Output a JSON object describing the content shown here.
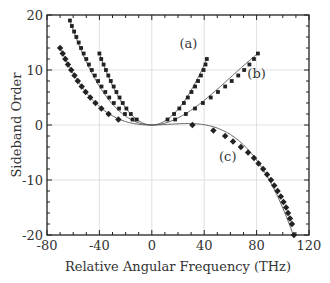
{
  "chart_data": {
    "type": "line",
    "title": "",
    "xlabel": "Relative Angular Frequency (THz)",
    "ylabel": "Sideband Order",
    "xlim": [
      -80,
      120
    ],
    "ylim": [
      -20,
      20
    ],
    "xticks": [
      -80,
      -40,
      0,
      40,
      80,
      120
    ],
    "yticks": [
      -20,
      -10,
      0,
      10,
      20
    ],
    "xtick_labels": [
      "-80",
      "-40",
      "0",
      "40",
      "80",
      "120"
    ],
    "ytick_labels": [
      "-20",
      "-10",
      "0",
      "10",
      "20"
    ],
    "grid": true,
    "legend": "none (curves labeled inline)",
    "series": [
      {
        "name": "(a)",
        "marker": "square",
        "fit": {
          "a2": 0.00748,
          "a3": -1.61e-05
        },
        "x": [
          -40,
          -38.6,
          -36.8,
          -35,
          -33.2,
          -31.3,
          -29.1,
          -27,
          -24.6,
          -22.2,
          -19.4,
          -16,
          -11.5,
          12,
          17,
          21,
          24.5,
          27.5,
          30.3,
          33,
          35.3,
          37.5,
          39.5,
          41,
          42
        ],
        "y": [
          13,
          12,
          11,
          10,
          9,
          8,
          7,
          6,
          5,
          4,
          3,
          2,
          1,
          1,
          2,
          3,
          4,
          5,
          6,
          7,
          8,
          9,
          10,
          11,
          12
        ]
      },
      {
        "name": "(b)",
        "marker": "square",
        "fit": {
          "a2": 0.0036,
          "a3": -2e-05
        },
        "x": [
          -62.5,
          -61,
          -59.3,
          -57.6,
          -55.8,
          -54,
          -52,
          -50,
          -48,
          -45.8,
          -43.5,
          -41,
          -38.4,
          -35.5,
          -32.5,
          -29,
          -25,
          -20.5,
          -14.7,
          17.8,
          26,
          33,
          39,
          45,
          50.5,
          56,
          61,
          66,
          70.5,
          74.5,
          78,
          81
        ],
        "y": [
          19,
          18,
          17,
          16,
          15,
          14,
          13,
          12,
          11,
          10,
          9,
          8,
          7,
          6,
          5,
          4,
          3,
          2,
          1,
          1,
          2,
          3,
          4,
          5,
          6,
          7,
          8,
          9,
          10,
          11,
          12,
          13
        ]
      },
      {
        "name": "(c)",
        "marker": "diamond",
        "fit": {
          "a2": 0.00106,
          "a3": -2.57e-05
        },
        "x": [
          -70,
          -68,
          -66,
          -64,
          -61.5,
          -59,
          -56.5,
          -53.5,
          -50.5,
          -47,
          -43,
          -38.5,
          -33,
          -25.5,
          31,
          47,
          56,
          62,
          68,
          73.5,
          78,
          81.5,
          85,
          88,
          91,
          93.5,
          96,
          98.5,
          100.5,
          102.5,
          104,
          105.5,
          107,
          108.5
        ],
        "y": [
          14,
          13,
          12,
          11,
          10,
          9,
          8,
          7,
          6,
          5,
          4,
          3,
          2,
          1,
          0,
          -1,
          -2,
          -3,
          -4,
          -5,
          -6,
          -7,
          -8,
          -9,
          -10,
          -11,
          -12,
          -13,
          -14,
          -15,
          -16,
          -17,
          -18,
          -20
        ]
      }
    ],
    "annotations": [
      {
        "text": "(a)",
        "x": 28,
        "y": 14
      },
      {
        "text": "(b)",
        "x": 80,
        "y": 8.5
      },
      {
        "text": "(c)",
        "x": 58,
        "y": -6.5
      }
    ]
  }
}
